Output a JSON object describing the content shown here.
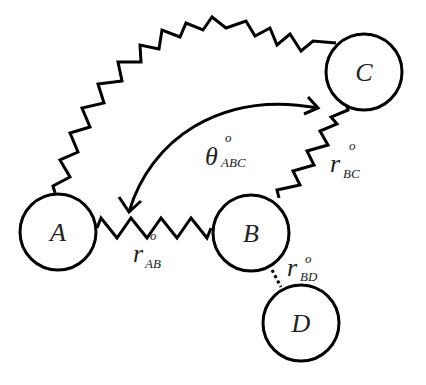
{
  "diagram": {
    "type": "molecular-mechanics-spring-model",
    "colors": {
      "stroke": "#000000",
      "text": "#222222",
      "background": "#ffffff"
    },
    "atoms": [
      {
        "id": "A",
        "label": "A",
        "cx": 58,
        "cy": 232,
        "r": 38
      },
      {
        "id": "B",
        "label": "B",
        "cx": 251,
        "cy": 233,
        "r": 38
      },
      {
        "id": "C",
        "label": "C",
        "cx": 364,
        "cy": 72,
        "r": 38
      },
      {
        "id": "D",
        "label": "D",
        "cx": 301,
        "cy": 323,
        "r": 38
      }
    ],
    "bonds": [
      {
        "from": "A",
        "to": "B",
        "style": "spring",
        "label_symbol": "r",
        "label_sub": "AB",
        "label_sup": "o"
      },
      {
        "from": "B",
        "to": "C",
        "style": "spring",
        "label_symbol": "r",
        "label_sub": "BC",
        "label_sup": "o"
      },
      {
        "from": "A",
        "to": "C",
        "style": "spring-arc"
      },
      {
        "from": "B",
        "to": "D",
        "style": "dotted",
        "label_symbol": "r",
        "label_sub": "BD",
        "label_sup": "o"
      }
    ],
    "angle": {
      "label_symbol": "θ",
      "label_sub": "ABC",
      "label_sup": "o",
      "arrow": "double-headed-arc"
    }
  }
}
